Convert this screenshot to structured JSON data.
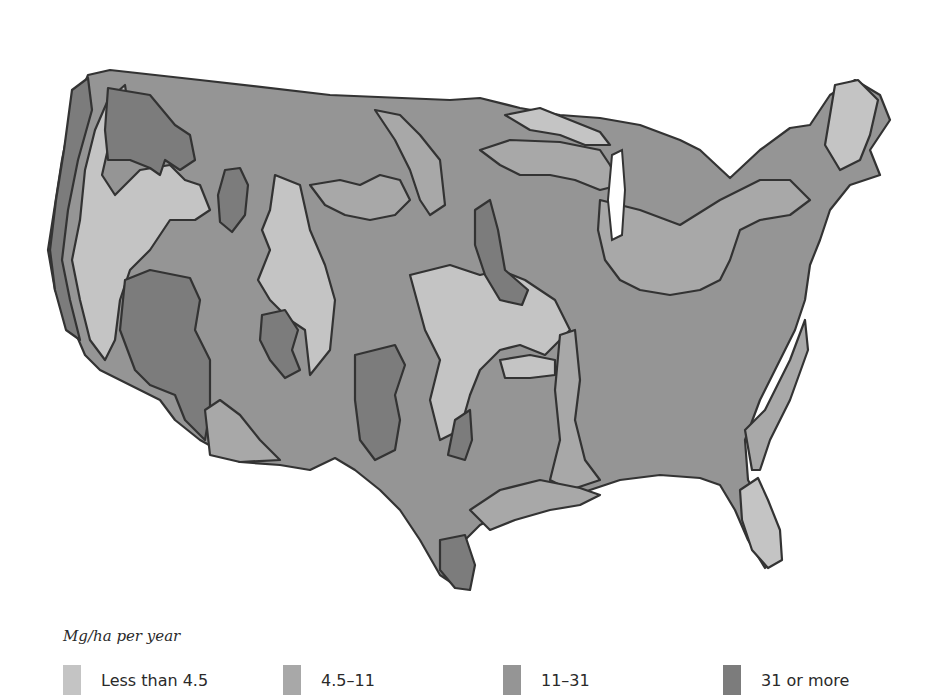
{
  "map": {
    "subject": "Contiguous United States",
    "style": "grayscale choropleth"
  },
  "legend": {
    "title": "Mg/ha per year",
    "items": [
      {
        "label": "Less than 4.5",
        "color": "#c4c4c4"
      },
      {
        "label": "4.5–11",
        "color": "#a8a8a8"
      },
      {
        "label": "11–31",
        "color": "#959595"
      },
      {
        "label": "31 or more",
        "color": "#7c7c7c"
      }
    ]
  },
  "colors": {
    "outline": "#333333",
    "water": "#ffffff",
    "background": "#ffffff"
  }
}
